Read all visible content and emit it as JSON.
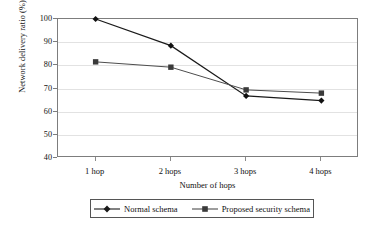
{
  "chart_data": {
    "type": "line",
    "title": "",
    "xlabel": "Number of hops",
    "ylabel": "Network delivery ratio (%)",
    "categories": [
      "1 hop",
      "2 hops",
      "3 hops",
      "4 hops"
    ],
    "ylim": [
      40,
      100
    ],
    "yticks": [
      40,
      50,
      60,
      70,
      80,
      90,
      100
    ],
    "ytick_labels": [
      "40",
      "50",
      "60",
      "70",
      "80",
      "90",
      "100"
    ],
    "grid": true,
    "legend_position": "bottom",
    "series": [
      {
        "name": "Normal schema",
        "marker": "diamond",
        "color": "#1a1a1a",
        "values": [
          100,
          88.5,
          66.8,
          64.8
        ]
      },
      {
        "name": "Proposed security schema",
        "marker": "square",
        "color": "#4d4d4d",
        "values": [
          81.5,
          79.2,
          69.4,
          68
        ]
      }
    ]
  },
  "colors": {
    "frame": "#7d7d7d",
    "grid": "#e2e2e2",
    "series_1": "#1a1a1a",
    "series_2": "#4d4d4d",
    "background": "#ffffff"
  }
}
